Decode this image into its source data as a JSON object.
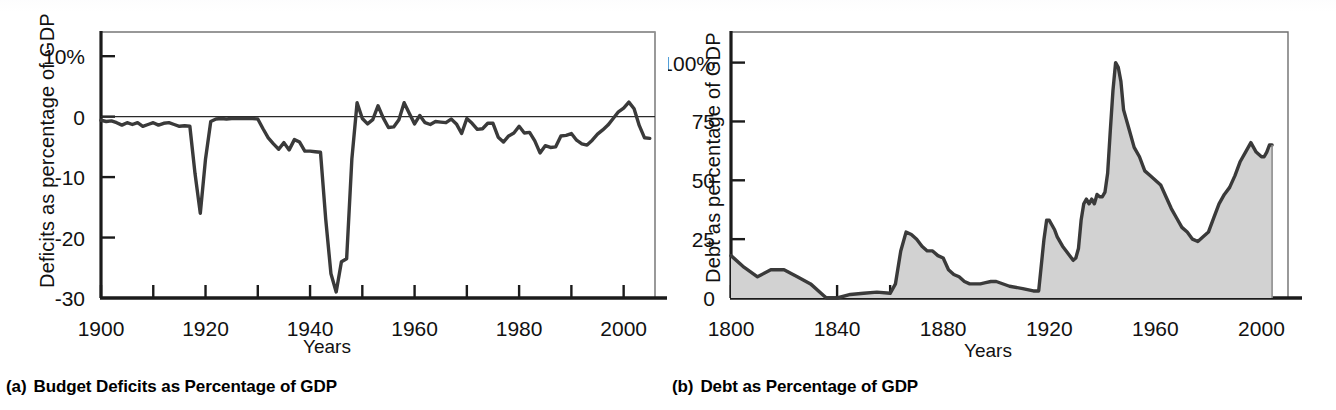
{
  "figure": {
    "panels": [
      {
        "mark": "(a)",
        "caption": "Budget Deficits as Percentage of GDP",
        "ylabel": "Deficits as percentage of GDP",
        "xlabel": "Years"
      },
      {
        "mark": "(b)",
        "caption": "Debt as Percentage of GDP",
        "ylabel": "Debt as percentage of GDP",
        "xlabel": "Years"
      }
    ],
    "colors": {
      "line": "#3a3a3a",
      "area_fill": "#d2d2d2",
      "axis": "#1b1b1b",
      "box": "#6f6f6f",
      "text": "#111111"
    }
  },
  "chart_data": [
    {
      "type": "line",
      "title": "Budget Deficits as Percentage of GDP",
      "subtitle": "(a)",
      "xlabel": "Years",
      "ylabel": "Deficits as percentage of GDP",
      "xlim": [
        1900,
        2006
      ],
      "ylim": [
        -30,
        14
      ],
      "ytick_labels": [
        "10%",
        "0",
        "-10",
        "-20",
        "-30"
      ],
      "yticks": [
        10,
        0,
        -10,
        -20,
        -30
      ],
      "xtick_labels": [
        "1900",
        "1920",
        "1940",
        "1960",
        "1980",
        "2000"
      ],
      "xticks_labeled": [
        1900,
        1920,
        1940,
        1960,
        1980,
        2000
      ],
      "xticks_minor_step": 10,
      "grid": false,
      "legend": "none",
      "zero_reference_line": true,
      "x": [
        1900,
        1901,
        1902,
        1903,
        1904,
        1905,
        1906,
        1907,
        1908,
        1909,
        1910,
        1911,
        1912,
        1913,
        1914,
        1915,
        1916,
        1917,
        1918,
        1919,
        1920,
        1921,
        1922,
        1923,
        1924,
        1925,
        1926,
        1927,
        1928,
        1929,
        1930,
        1931,
        1932,
        1933,
        1934,
        1935,
        1936,
        1937,
        1938,
        1939,
        1940,
        1941,
        1942,
        1943,
        1944,
        1945,
        1946,
        1947,
        1948,
        1949,
        1950,
        1951,
        1952,
        1953,
        1954,
        1955,
        1956,
        1957,
        1958,
        1959,
        1960,
        1961,
        1962,
        1963,
        1964,
        1965,
        1966,
        1967,
        1968,
        1969,
        1970,
        1971,
        1972,
        1973,
        1974,
        1975,
        1976,
        1977,
        1978,
        1979,
        1980,
        1981,
        1982,
        1983,
        1984,
        1985,
        1986,
        1987,
        1988,
        1989,
        1990,
        1991,
        1992,
        1993,
        1994,
        1995,
        1996,
        1997,
        1998,
        1999,
        2000,
        2001,
        2002,
        2003,
        2004,
        2005
      ],
      "values": [
        -0.6,
        -0.8,
        -0.7,
        -1.0,
        -1.4,
        -1.0,
        -1.3,
        -1.0,
        -1.6,
        -1.3,
        -1.0,
        -1.4,
        -1.1,
        -1.0,
        -1.3,
        -1.6,
        -1.5,
        -1.6,
        -9.5,
        -16.0,
        -7.0,
        -0.8,
        -0.4,
        -0.3,
        -0.4,
        -0.3,
        -0.3,
        -0.3,
        -0.3,
        -0.3,
        -0.4,
        -2.0,
        -3.5,
        -4.5,
        -5.4,
        -4.3,
        -5.5,
        -3.8,
        -4.2,
        -5.7,
        -5.7,
        -5.8,
        -5.9,
        -17.0,
        -26.0,
        -29.0,
        -24.0,
        -23.5,
        -7.0,
        2.3,
        -0.3,
        -1.2,
        -0.5,
        1.8,
        -0.2,
        -1.8,
        -1.7,
        -0.5,
        2.3,
        0.5,
        -1.2,
        0.2,
        -1.0,
        -1.3,
        -0.8,
        -0.9,
        -1.0,
        -0.4,
        -1.2,
        -2.8,
        -0.3,
        -1.1,
        -2.1,
        -2.0,
        -1.1,
        -1.1,
        -3.4,
        -4.2,
        -3.2,
        -2.7,
        -1.6,
        -2.7,
        -2.6,
        -4.0,
        -6.0,
        -4.8,
        -5.1,
        -5.0,
        -3.2,
        -3.1,
        -2.8,
        -3.9,
        -4.5,
        -4.7,
        -3.9,
        -2.9,
        -2.2,
        -1.4,
        -0.3,
        0.8,
        1.4,
        2.4,
        1.3,
        -1.5,
        -3.5,
        -3.6,
        -2.6
      ],
      "annotations": [
        {
          "label": "World War I deficit peak",
          "x": 1919,
          "y": -16.0
        },
        {
          "label": "World War II deficit peak",
          "x": 1945,
          "y": -29.0
        },
        {
          "label": "Surplus around 2000",
          "x": 2000,
          "y": 2.4
        }
      ]
    },
    {
      "type": "area",
      "title": "Debt as Percentage of GDP",
      "subtitle": "(b)",
      "xlabel": "Years",
      "ylabel": "Debt as percentage of GDP",
      "xlim": [
        1800,
        2010
      ],
      "ylim": [
        0,
        113
      ],
      "ytick_labels": [
        "100%",
        "75",
        "50",
        "25",
        "0"
      ],
      "yticks": [
        100,
        75,
        50,
        25,
        0
      ],
      "xtick_labels": [
        "1800",
        "1840",
        "1880",
        "1920",
        "1960",
        "2000"
      ],
      "xticks_labeled": [
        1800,
        1840,
        1880,
        1920,
        1960,
        2000
      ],
      "xticks_minor_step": 20,
      "grid": false,
      "legend": "none",
      "x": [
        1800,
        1805,
        1810,
        1815,
        1820,
        1825,
        1830,
        1835,
        1836,
        1840,
        1845,
        1850,
        1855,
        1860,
        1862,
        1864,
        1866,
        1868,
        1870,
        1872,
        1874,
        1876,
        1878,
        1880,
        1882,
        1884,
        1886,
        1888,
        1890,
        1892,
        1894,
        1896,
        1898,
        1900,
        1905,
        1910,
        1914,
        1916,
        1918,
        1919,
        1920,
        1921,
        1922,
        1923,
        1925,
        1927,
        1929,
        1930,
        1931,
        1932,
        1933,
        1934,
        1935,
        1936,
        1937,
        1938,
        1939,
        1940,
        1941,
        1942,
        1943,
        1944,
        1945,
        1946,
        1947,
        1948,
        1949,
        1950,
        1952,
        1954,
        1956,
        1958,
        1960,
        1962,
        1964,
        1966,
        1968,
        1970,
        1972,
        1974,
        1976,
        1978,
        1980,
        1982,
        1984,
        1986,
        1988,
        1990,
        1992,
        1994,
        1996,
        1997,
        1998,
        2000,
        2001,
        2002,
        2003,
        2004
      ],
      "values": [
        18,
        13,
        9,
        12,
        12,
        9,
        6,
        1,
        0,
        0,
        1.5,
        2,
        2.5,
        2,
        6,
        20,
        28,
        27,
        25,
        22,
        20,
        20,
        18,
        17,
        12,
        10,
        9,
        7,
        6,
        6,
        6,
        6.5,
        7,
        7,
        5,
        4,
        3,
        3,
        25,
        33,
        33,
        31,
        29,
        26,
        22,
        19,
        16,
        17,
        21,
        33,
        40,
        42,
        40,
        42,
        40,
        44,
        43,
        43,
        45,
        53,
        71,
        88,
        100,
        98,
        92,
        80,
        76,
        72,
        64,
        60,
        54,
        52,
        50,
        48,
        43,
        38,
        34,
        30,
        28,
        25,
        24,
        26,
        28,
        34,
        40,
        44,
        47,
        52,
        58,
        62,
        66,
        64,
        62,
        60,
        60,
        62,
        65,
        65
      ],
      "annotations": [
        {
          "label": "World War II debt peak",
          "x": 1945,
          "y": 100
        },
        {
          "label": "Civil War debt peak",
          "x": 1866,
          "y": 28
        },
        {
          "label": "Postwar low",
          "x": 1974,
          "y": 24
        }
      ]
    }
  ]
}
